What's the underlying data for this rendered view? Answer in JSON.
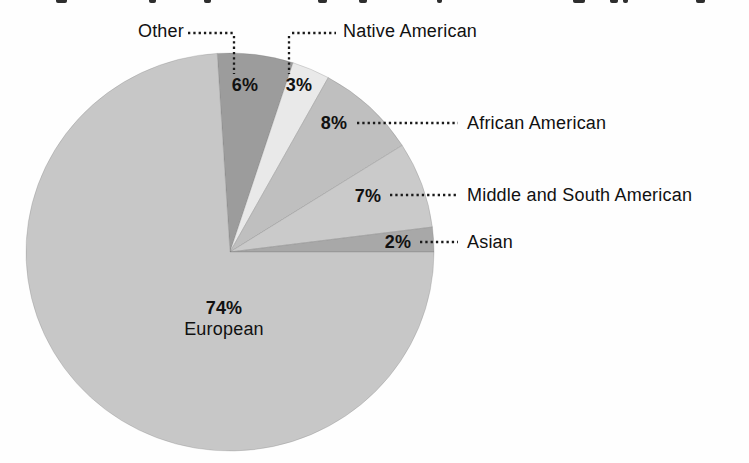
{
  "figure": {
    "title_note": "chart title cropped out of frame at top edge; only descender fragments of the title text are visible"
  },
  "chart_data": {
    "type": "pie",
    "categories": [
      "Other",
      "Native American",
      "African American",
      "Middle and South American",
      "Asian",
      "European"
    ],
    "values": [
      6,
      3,
      8,
      7,
      2,
      74
    ],
    "unit": "%",
    "slices": [
      {
        "label": "Other",
        "value": 6,
        "pct_label": "6%",
        "color": "#9c9c9c"
      },
      {
        "label": "Native American",
        "value": 3,
        "pct_label": "3%",
        "color": "#e9e9e9"
      },
      {
        "label": "African American",
        "value": 8,
        "pct_label": "8%",
        "color": "#bfbfbf"
      },
      {
        "label": "Middle and South American",
        "value": 7,
        "pct_label": "7%",
        "color": "#cacaca"
      },
      {
        "label": "Asian",
        "value": 2,
        "pct_label": "2%",
        "color": "#a8a8a8"
      },
      {
        "label": "European",
        "value": 74,
        "pct_label": "74%",
        "color": "#c7c7c7"
      }
    ],
    "start_angle_deg": -3.6,
    "direction": "clockwise",
    "legend_position": "none",
    "label_style": "direct percentage labels on slices with dotted leader lines to category names",
    "leader_line_color": "#1a1a1a",
    "leader_lines": [
      {
        "name": "other-horizontal",
        "x1": 188,
        "y1": 33,
        "x2": 234,
        "y2": 33
      },
      {
        "name": "other-vertical",
        "x1": 234,
        "y1": 36,
        "x2": 234,
        "y2": 74
      },
      {
        "name": "native-american-vertical",
        "x1": 289,
        "y1": 36,
        "x2": 289,
        "y2": 74
      },
      {
        "name": "native-american-horizontal",
        "x1": 292,
        "y1": 33,
        "x2": 336,
        "y2": 33
      },
      {
        "name": "african-american-leader",
        "x1": 357,
        "y1": 123,
        "x2": 458,
        "y2": 123
      },
      {
        "name": "middle-south-leader",
        "x1": 390,
        "y1": 195,
        "x2": 458,
        "y2": 195
      },
      {
        "name": "asian-leader",
        "x1": 420,
        "y1": 242,
        "x2": 458,
        "y2": 242
      }
    ],
    "geometry": {
      "cx": 230,
      "cy": 252,
      "rx": 204,
      "ry": 199
    },
    "background": "#fefefe",
    "text_color": "#111111"
  },
  "artifacts": {
    "cropped_title_marks": [
      {
        "x": 56,
        "w": 11
      },
      {
        "x": 149,
        "w": 7
      },
      {
        "x": 204,
        "w": 7
      },
      {
        "x": 318,
        "w": 9
      },
      {
        "x": 359,
        "w": 8
      },
      {
        "x": 437,
        "w": 5
      },
      {
        "x": 573,
        "w": 12
      },
      {
        "x": 610,
        "w": 8
      },
      {
        "x": 623,
        "w": 5
      },
      {
        "x": 696,
        "w": 9
      }
    ]
  }
}
